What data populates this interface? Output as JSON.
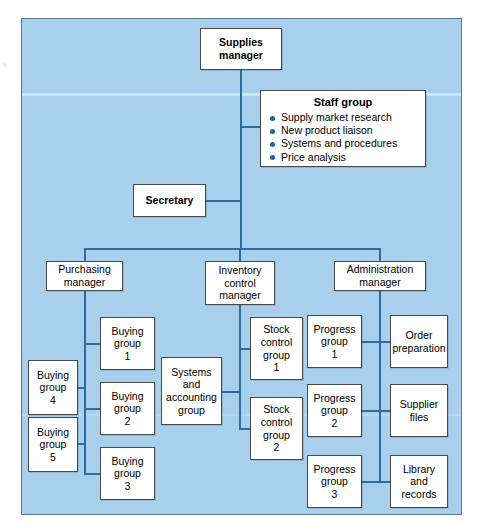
{
  "diagram": {
    "title_node": {
      "label": "Supplies\nmanager"
    },
    "staff_group": {
      "title": "Staff group",
      "items": [
        "Supply market research",
        "New product liaison",
        "Systems and procedures",
        "Price analysis"
      ]
    },
    "secretary": {
      "label": "Secretary"
    },
    "managers": [
      {
        "label": "Purchasing\nmanager"
      },
      {
        "label": "Inventory\ncontrol\nmanager"
      },
      {
        "label": "Administration\nmanager"
      }
    ],
    "purchasing_branch": {
      "right_column": [
        "Buying\ngroup\n1",
        "Buying\ngroup\n2",
        "Buying\ngroup\n3"
      ],
      "left_column": [
        "Buying\ngroup\n4",
        "Buying\ngroup\n5"
      ]
    },
    "inventory_branch": {
      "left_column": [
        "Systems\nand\naccounting\ngroup"
      ],
      "right_column": [
        "Stock\ncontrol\ngroup\n1",
        "Stock\ncontrol\ngroup\n2"
      ]
    },
    "administration_branch": {
      "left_column": [
        "Progress\ngroup\n1",
        "Progress\ngroup\n2",
        "Progress\ngroup\n3"
      ],
      "right_column": [
        "Order\npreparation",
        "Supplier\nfiles",
        "Library\nand\nrecords"
      ]
    },
    "colors": {
      "panel_background": "#a8cfeb",
      "panel_border": "#5a7a93",
      "connector": "#2b6ca3",
      "node_background": "#ffffff",
      "node_border": "#4a4a4a",
      "bullet": "#2060a8"
    }
  }
}
